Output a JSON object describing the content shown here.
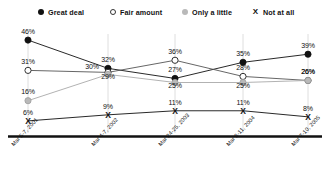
{
  "legend": {
    "position": "top",
    "items": [
      {
        "label": "Great deal",
        "marker": "filled-circle-icon",
        "color": "#111111",
        "x": 38
      },
      {
        "label": "Fair amount",
        "marker": "open-circle-icon",
        "color": "#333333",
        "x": 110
      },
      {
        "label": "Only a little",
        "marker": "gray-circle-icon",
        "color": "#b9b9b9",
        "x": 182
      },
      {
        "label": "Not at all",
        "marker": "x-icon",
        "color": "#111111",
        "x": 252
      }
    ]
  },
  "chart_data": {
    "type": "line",
    "title": "",
    "xlabel": "",
    "ylabel": "",
    "ylim": [
      0,
      50
    ],
    "grid": "vertical",
    "categories": [
      "Mar 5-7, 2001",
      "Mar 4-7, 2002",
      "Mar 24-25, 2003",
      "Mar 8-11, 2004",
      "Mar 7-10, 2005"
    ],
    "series": [
      {
        "name": "Great deal",
        "marker": "filled-circle",
        "color": "#111111",
        "values": [
          46,
          32,
          27,
          35,
          39
        ],
        "labels": [
          "46%",
          "32%",
          "27%",
          "35%",
          "39%"
        ]
      },
      {
        "name": "Fair amount",
        "marker": "open-circle",
        "color": "#555555",
        "values": [
          31,
          30,
          36,
          28,
          26
        ],
        "labels": [
          "31%",
          "30%",
          "36%",
          "28%",
          "26%"
        ]
      },
      {
        "name": "Only a little",
        "marker": "gray-circle",
        "color": "#a9a9a9",
        "values": [
          16,
          29,
          25,
          25,
          26
        ],
        "labels": [
          "16%",
          "29%",
          "25%",
          "25%",
          "26%"
        ]
      },
      {
        "name": "Not at all",
        "marker": "x",
        "color": "#111111",
        "values": [
          6,
          9,
          11,
          11,
          8
        ],
        "labels": [
          "6%",
          "9%",
          "11%",
          "11%",
          "8%"
        ]
      }
    ]
  }
}
